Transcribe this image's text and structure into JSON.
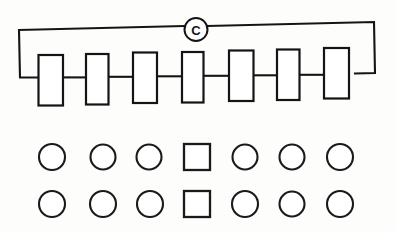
{
  "figure": {
    "background_color": "#fdfdfc",
    "ink_color": "#141414",
    "width": 396,
    "height": 233
  },
  "circuit": {
    "name": "series-loop",
    "source": {
      "symbol_name": "source-c-icon",
      "label": "C",
      "shape": "circle",
      "cx": 196,
      "cy": 29.5,
      "r": 11.5
    },
    "loop_path": "M 19,30 L 184.5,26 M 207.5,26 L 374,22 L 375,73 L 355,73.5 M 19,30 L 20,77.5 L 39,77.5",
    "elements": [
      {
        "name": "element-1",
        "x": 38.5,
        "y": 55,
        "width": 24.5,
        "height": 50.5,
        "wire_y": 77.5
      },
      {
        "name": "element-2",
        "x": 86,
        "y": 54,
        "width": 22.5,
        "height": 50.5,
        "wire_y": 77.0
      },
      {
        "name": "element-3",
        "x": 133,
        "y": 52.5,
        "width": 24.0,
        "height": 50.5,
        "wire_y": 76.5
      },
      {
        "name": "element-4",
        "x": 182,
        "y": 52,
        "width": 21.5,
        "height": 50.5,
        "wire_y": 76.0
      },
      {
        "name": "element-5",
        "x": 229,
        "y": 50.5,
        "width": 24.5,
        "height": 50.5,
        "wire_y": 75.5
      },
      {
        "name": "element-6",
        "x": 277,
        "y": 49.5,
        "width": 22.5,
        "height": 50.5,
        "wire_y": 75.0
      },
      {
        "name": "element-7",
        "x": 324,
        "y": 48,
        "width": 25.0,
        "height": 50.5,
        "wire_y": 74.5
      }
    ],
    "connector_wires": [
      {
        "name": "wire-1-2",
        "x1": 63.0,
        "x2": 86.0,
        "y": 77.4
      },
      {
        "name": "wire-2-3",
        "x1": 108.5,
        "x2": 133.0,
        "y": 76.8
      },
      {
        "name": "wire-3-4",
        "x1": 157.0,
        "x2": 182.0,
        "y": 76.3
      },
      {
        "name": "wire-4-5",
        "x1": 203.5,
        "x2": 229.0,
        "y": 75.8
      },
      {
        "name": "wire-5-6",
        "x1": 253.5,
        "x2": 277.0,
        "y": 75.3
      },
      {
        "name": "wire-6-7",
        "x1": 299.5,
        "x2": 324.0,
        "y": 74.8
      }
    ]
  },
  "node_grid": {
    "name": "node-symbol-grid",
    "columns": 7,
    "rows": [
      {
        "name": "node-row-1",
        "center_y": 157,
        "cells": [
          {
            "name": "node-1-1",
            "shape": "circle",
            "cx": 52,
            "r": 13
          },
          {
            "name": "node-1-2",
            "shape": "circle",
            "cx": 103,
            "r": 12.5
          },
          {
            "name": "node-1-3",
            "shape": "circle",
            "cx": 149,
            "r": 12.5
          },
          {
            "name": "node-1-4",
            "shape": "square",
            "cx": 197,
            "size": 26
          },
          {
            "name": "node-1-5",
            "shape": "circle",
            "cx": 245,
            "r": 12.5
          },
          {
            "name": "node-1-6",
            "shape": "circle",
            "cx": 292,
            "r": 12.5
          },
          {
            "name": "node-1-7",
            "shape": "circle",
            "cx": 340,
            "r": 13
          }
        ]
      },
      {
        "name": "node-row-2",
        "center_y": 204,
        "cells": [
          {
            "name": "node-2-1",
            "shape": "circle",
            "cx": 52,
            "r": 13
          },
          {
            "name": "node-2-2",
            "shape": "circle",
            "cx": 103,
            "r": 13
          },
          {
            "name": "node-2-3",
            "shape": "circle",
            "cx": 150,
            "r": 13
          },
          {
            "name": "node-2-4",
            "shape": "square",
            "cx": 197,
            "size": 26
          },
          {
            "name": "node-2-5",
            "shape": "circle",
            "cx": 245,
            "r": 13
          },
          {
            "name": "node-2-6",
            "shape": "circle",
            "cx": 292,
            "r": 12.5
          },
          {
            "name": "node-2-7",
            "shape": "circle",
            "cx": 340,
            "r": 13
          }
        ]
      }
    ]
  }
}
